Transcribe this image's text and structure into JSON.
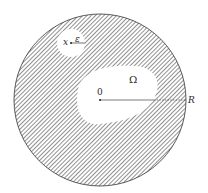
{
  "diagram": {
    "colors": {
      "background": "#ffffff",
      "hatch": "#555555",
      "outline": "#333333",
      "label": "#2a2a2a"
    },
    "outer_disk": {
      "cx": 100,
      "cy": 100,
      "r": 86
    },
    "small_disk": {
      "cx": 71,
      "cy": 43,
      "r": 14
    },
    "labels": {
      "origin": "0",
      "region": "Ω",
      "radius_outer": "R",
      "point": "x",
      "radius_small": "ε"
    }
  }
}
